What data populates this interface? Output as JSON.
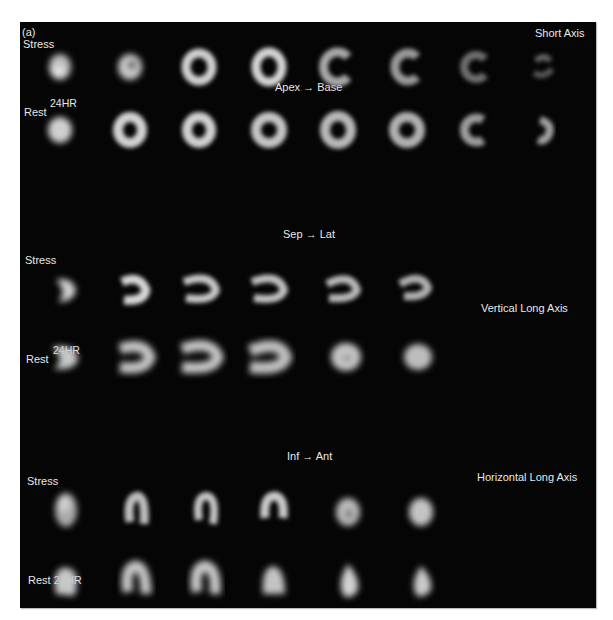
{
  "figure": {
    "panel_label": "(a)",
    "colors": {
      "background": "#050505",
      "text": "#e8e8e8",
      "page": "#ffffff"
    }
  },
  "short_axis": {
    "title": "Short Axis",
    "direction": "Apex → Base",
    "rows": [
      {
        "label": "Stress",
        "superscript": "",
        "slice_count": 8
      },
      {
        "label": "Rest",
        "superscript": "24HR",
        "slice_count": 8
      }
    ]
  },
  "vertical_long_axis": {
    "title": "Vertical Long Axis",
    "direction": "Sep → Lat",
    "rows": [
      {
        "label": "Stress",
        "superscript": "",
        "slice_count": 6
      },
      {
        "label": "Rest",
        "superscript": "24HR",
        "slice_count": 6
      }
    ]
  },
  "horizontal_long_axis": {
    "title": "Horizontal Long Axis",
    "direction": "Inf → Ant",
    "rows": [
      {
        "label": "Stress",
        "superscript": "",
        "slice_count": 6
      },
      {
        "label": "Rest 24HR",
        "superscript": "",
        "slice_count": 6
      }
    ]
  }
}
